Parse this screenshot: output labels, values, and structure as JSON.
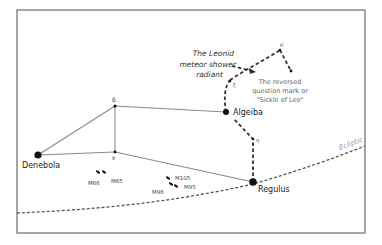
{
  "diagram": {
    "colors": {
      "frame": "#777777",
      "constellation_line": "#8a8a8a",
      "sickle_line": "#333333",
      "ecliptic_line": "#555555",
      "star": "#111111",
      "text": "#222222",
      "annotation": "#666666",
      "ecliptic_label": "#999999"
    },
    "stars": [
      {
        "id": "denebola",
        "label": "Denebola",
        "size": "large"
      },
      {
        "id": "delta",
        "label": "δ",
        "size": "small"
      },
      {
        "id": "theta",
        "label": "θ",
        "size": "small"
      },
      {
        "id": "algeiba",
        "label": "Algeiba",
        "size": "large"
      },
      {
        "id": "regulus",
        "label": "Regulus",
        "size": "large"
      },
      {
        "id": "zeta",
        "label": "ζ",
        "size": "small"
      },
      {
        "id": "mu",
        "label": "μ",
        "size": "small"
      },
      {
        "id": "epsilon",
        "label": "",
        "size": "small"
      },
      {
        "id": "eta",
        "label": "η",
        "size": "small"
      }
    ],
    "galaxies": [
      {
        "id": "m66",
        "label": "M66"
      },
      {
        "id": "m65",
        "label": "M65"
      },
      {
        "id": "m105",
        "label": "M105"
      },
      {
        "id": "m96",
        "label": "M96"
      },
      {
        "id": "m95",
        "label": "M95"
      }
    ],
    "annotations": {
      "radiant_line1": "The Leonid",
      "radiant_line2": "meteor shower",
      "radiant_line3": "radiant",
      "sickle_line1": "The reversed",
      "sickle_line2": "question mark or",
      "sickle_line3": "\"Sickle of Leo\"",
      "ecliptic": "Ecliptic"
    }
  }
}
